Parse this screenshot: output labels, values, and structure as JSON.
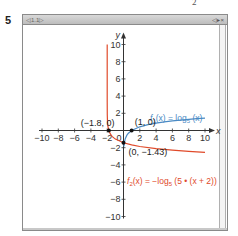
{
  "page": {
    "problem_number": "5",
    "top_mark": "2"
  },
  "window": {
    "tab_label": "◁1.1▷",
    "controls": "◁▸×"
  },
  "chart_data": {
    "type": "line",
    "title": "",
    "xlabel": "x",
    "ylabel": "y",
    "xlim": [
      -10,
      10
    ],
    "ylim": [
      -10,
      10
    ],
    "grid": false,
    "x_ticks": [
      -10,
      -8,
      -6,
      -4,
      -2,
      2,
      4,
      6,
      8,
      10
    ],
    "y_ticks": [
      10,
      8,
      6,
      4,
      2,
      -2,
      -4,
      -6,
      -8,
      -10
    ],
    "x_tick_labels": [
      "−10",
      "−8",
      "−6",
      "−4",
      "−2",
      "2",
      "4",
      "6",
      "8",
      "10"
    ],
    "y_tick_labels": [
      "10",
      "8",
      "6",
      "4",
      "2",
      "−2",
      "−4",
      "−6",
      "−8",
      "−10"
    ],
    "origin_label": "0",
    "series": [
      {
        "name": "f1(x) = log5(x)",
        "label_main": "f",
        "label_sub": "1",
        "label_rest": "(x) = log",
        "label_base": "5",
        "label_tail": " (x)",
        "color": "#4a8ac4",
        "x": [
          0.05,
          0.1,
          0.2,
          0.4,
          0.6,
          1,
          2,
          3,
          4,
          5,
          6,
          7,
          8,
          9,
          10
        ],
        "y": [
          -1.86,
          -1.43,
          -1.0,
          -0.57,
          -0.32,
          0,
          0.43,
          0.68,
          0.86,
          1.0,
          1.11,
          1.21,
          1.29,
          1.37,
          1.43
        ]
      },
      {
        "name": "f2(x) = −log5(5 • (x + 2))",
        "label_main": "f",
        "label_sub": "2",
        "label_rest": "(x) = −log",
        "label_base": "5",
        "label_tail": " (5 • (x + 2))",
        "color": "#e04a2a",
        "x": [
          -1.9999,
          -1.999,
          -1.99,
          -1.97,
          -1.95,
          -1.9,
          -1.8,
          -1.6,
          -1.4,
          -1,
          0,
          1,
          2,
          4,
          6,
          8,
          10
        ],
        "y": [
          4.72,
          3.29,
          1.86,
          1.18,
          0.86,
          0.43,
          0,
          -0.43,
          -0.68,
          -1.0,
          -1.43,
          -1.68,
          -1.86,
          -2.11,
          -2.29,
          -2.43,
          -2.54
        ]
      }
    ],
    "annotations": [
      {
        "text": "(−1.8, 0)",
        "x": -1.8,
        "y": 0
      },
      {
        "text": "(1, 0)",
        "x": 1,
        "y": 0
      },
      {
        "text": "(0, −1.43)",
        "x": 0,
        "y": -1.43
      }
    ],
    "marked_points": [
      {
        "x": -1.8,
        "y": 0
      },
      {
        "x": 1,
        "y": 0
      },
      {
        "x": 0,
        "y": -1.43
      }
    ]
  }
}
